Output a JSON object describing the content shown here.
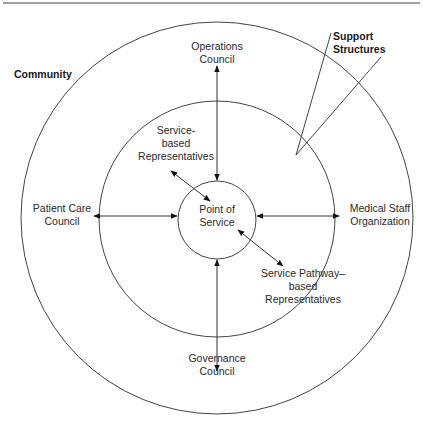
{
  "diagram": {
    "type": "concentric-circles",
    "rings": [
      {
        "name": "Community",
        "label": "Community"
      },
      {
        "name": "Support Structures",
        "label": "Support Structures"
      },
      {
        "name": "Point of Service",
        "label": "Point of Service"
      }
    ],
    "labels": {
      "community": "Community",
      "support_line1": "Support",
      "support_line2": "Structures",
      "operations_line1": "Operations",
      "operations_line2": "Council",
      "service_based_line1": "Service-",
      "service_based_line2": "based",
      "service_based_line3": "Representatives",
      "patient_care_line1": "Patient Care",
      "patient_care_line2": "Council",
      "point_line1": "Point of",
      "point_line2": "Service",
      "medical_staff_line1": "Medical Staff",
      "medical_staff_line2": "Organization",
      "pathway_line1": "Service Pathway–",
      "pathway_line2": "based",
      "pathway_line3": "Representatives",
      "governance_line1": "Governance",
      "governance_line2": "Council"
    },
    "connections": [
      {
        "from": "Operations Council",
        "to": "Point of Service",
        "bidirectional": true
      },
      {
        "from": "Service-based Representatives",
        "to": "Point of Service",
        "bidirectional": true
      },
      {
        "from": "Patient Care Council",
        "to": "Point of Service",
        "bidirectional": true
      },
      {
        "from": "Medical Staff Organization",
        "to": "Point of Service",
        "bidirectional": true
      },
      {
        "from": "Service Pathway–based Representatives",
        "to": "Point of Service",
        "bidirectional": true
      },
      {
        "from": "Governance Council",
        "to": "Point of Service",
        "bidirectional": true
      }
    ],
    "colors": {
      "stroke": "#333333",
      "text": "#2a2a2a",
      "background": "#ffffff"
    }
  }
}
